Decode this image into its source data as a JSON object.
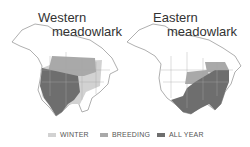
{
  "maps": [
    {
      "title_line1": "Western",
      "title_line2": "meadowlark"
    },
    {
      "title_line1": "Eastern",
      "title_line2": "meadowlark"
    }
  ],
  "legend": [
    {
      "label": "WINTER",
      "color": "#d2d2d2"
    },
    {
      "label": "BREEDING",
      "color": "#a9a9a9"
    },
    {
      "label": "ALL YEAR",
      "color": "#6e6e6e"
    }
  ],
  "colors": {
    "land": "#ffffff",
    "border": "#9a9a9a"
  }
}
